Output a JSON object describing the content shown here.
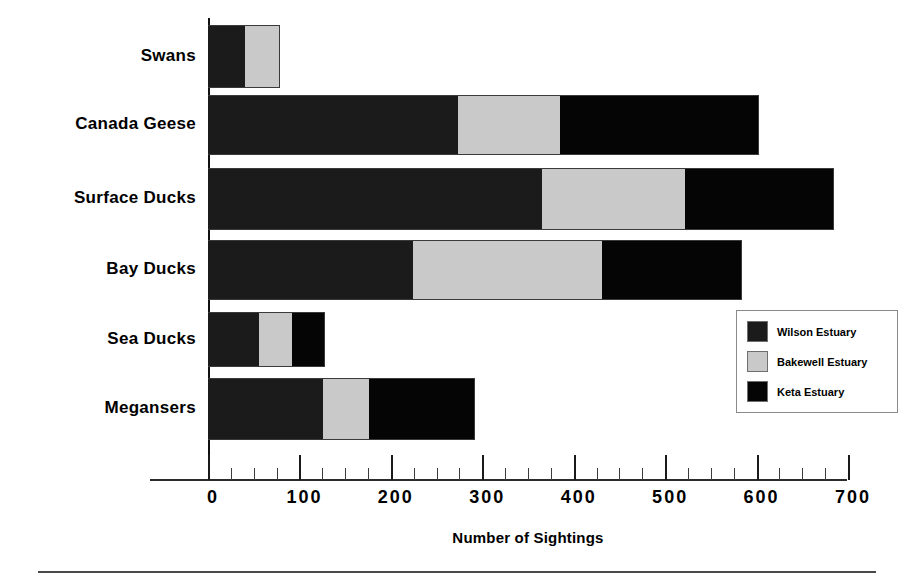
{
  "chart_data": {
    "type": "bar",
    "orientation": "horizontal",
    "stacked": true,
    "title": "",
    "xlabel": "Number of Sightings",
    "ylabel": "",
    "xlim": [
      0,
      700
    ],
    "xticks": [
      0,
      100,
      200,
      300,
      400,
      500,
      600,
      700
    ],
    "minor_tick_interval": 25,
    "grid": false,
    "legend_position": "right-lower",
    "categories": [
      "Swans",
      "Canada Geese",
      "Surface Ducks",
      "Bay Ducks",
      "Sea Ducks",
      "Megansers"
    ],
    "series": [
      {
        "name": "Wilson Estuary",
        "color": "#1b1b1b",
        "values": [
          41,
          274,
          366,
          225,
          56,
          126
        ]
      },
      {
        "name": "Bakewell Estuary",
        "color": "#c9c9c9",
        "values": [
          38,
          112,
          156,
          207,
          37,
          51
        ]
      },
      {
        "name": "Keta Estuary",
        "color": "#050505",
        "values": [
          0,
          217,
          163,
          152,
          35,
          115
        ]
      }
    ],
    "totals": [
      79,
      603,
      685,
      584,
      128,
      292
    ]
  },
  "axis": {
    "x_title": "Number of Sightings",
    "tick_labels": [
      "0",
      "100",
      "200",
      "300",
      "400",
      "500",
      "600",
      "700"
    ]
  },
  "legend": {
    "entries": [
      {
        "label": "Wilson Estuary",
        "color": "#1b1b1b"
      },
      {
        "label": "Bakewell Estuary",
        "color": "#c9c9c9"
      },
      {
        "label": "Keta Estuary",
        "color": "#050505"
      }
    ]
  },
  "categories": [
    {
      "label": "Swans"
    },
    {
      "label": "Canada Geese"
    },
    {
      "label": "Surface Ducks"
    },
    {
      "label": "Bay Ducks"
    },
    {
      "label": "Sea Ducks"
    },
    {
      "label": "Megansers"
    }
  ]
}
